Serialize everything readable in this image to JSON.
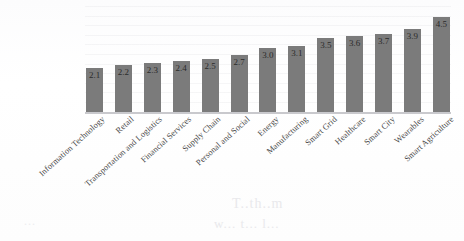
{
  "chart_data": {
    "type": "bar",
    "title": "",
    "subtitle": "",
    "xlabel": "",
    "ylabel": "",
    "ylim": [
      0,
      5
    ],
    "grid": true,
    "legend": "none",
    "orientation": "vertical",
    "bar_color": "#7b7b7b",
    "label_position": "inside-top",
    "categories": [
      "Information Technology",
      "Retail",
      "Transportation and Logistics",
      "Financial Services",
      "Supply Chain",
      "Personal and Social",
      "Energy",
      "Manufacturing",
      "Smart Grid",
      "Healthcare",
      "Smart City",
      "Wearables",
      "Smart Agriculture"
    ],
    "values": [
      2.1,
      2.2,
      2.3,
      2.4,
      2.5,
      2.7,
      3.0,
      3.1,
      3.5,
      3.6,
      3.7,
      3.9,
      4.5
    ],
    "value_labels": [
      "2.1",
      "2.2",
      "2.3",
      "2.4",
      "2.5",
      "2.7",
      "3.0",
      "3.1",
      "3.5",
      "3.6",
      "3.7",
      "3.9",
      "4.5"
    ],
    "tick_labels": []
  },
  "artifacts": {
    "bleed_1": "T..th..m",
    "bleed_2": "w... t... l...",
    "bleed_3": "..."
  }
}
